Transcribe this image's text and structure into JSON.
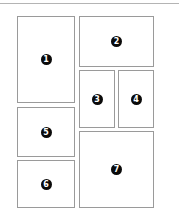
{
  "diagram": {
    "type": "page-layout-grid",
    "colors": {
      "border": "#9a9a9a",
      "badge_fill": "#0a0a0a",
      "badge_text": "#ffffff",
      "rule": "#b4b4b4"
    },
    "panels": [
      {
        "label": "1",
        "x": 17,
        "y": 16,
        "w": 58,
        "h": 87
      },
      {
        "label": "2",
        "x": 79,
        "y": 16,
        "w": 75,
        "h": 51
      },
      {
        "label": "3",
        "x": 79,
        "y": 70,
        "w": 36,
        "h": 58
      },
      {
        "label": "4",
        "x": 118,
        "y": 70,
        "w": 36,
        "h": 58
      },
      {
        "label": "5",
        "x": 17,
        "y": 107,
        "w": 58,
        "h": 50
      },
      {
        "label": "6",
        "x": 17,
        "y": 160,
        "w": 58,
        "h": 48
      },
      {
        "label": "7",
        "x": 79,
        "y": 131,
        "w": 75,
        "h": 77
      }
    ]
  }
}
